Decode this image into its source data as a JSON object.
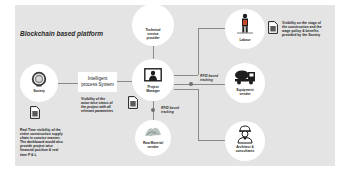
{
  "diagram": {
    "title": "Blockchain based platform",
    "colors": {
      "panel_bg": "#e4e4e4",
      "node_bg": "#ffffff",
      "line": "#8a8a8a",
      "text": "#222222"
    },
    "nodes": {
      "society": {
        "label": "Society",
        "icon": "society-seal-icon"
      },
      "intelligent_process": {
        "label_line1": "Intelligent",
        "label_line2": "process System"
      },
      "technical_service": {
        "label_line1": "Technical",
        "label_line2": "service",
        "label_line3": "provider"
      },
      "project_manager": {
        "label_line1": "Project",
        "label_line2": "Manager",
        "icon": "monitor-person-icon"
      },
      "raw_material": {
        "label_line1": "Raw Material",
        "label_line2": "vendor",
        "icon": "raw-material-icon"
      },
      "labour": {
        "label": "Labour",
        "icon": "worker-icon"
      },
      "equipment": {
        "label_line1": "Equipment",
        "label_line2": "vendor",
        "icon": "concrete-mixer-truck-icon"
      },
      "architect": {
        "label_line1": "Architect &",
        "label_line2": "consultants",
        "icon": "engineer-helmet-icon"
      }
    },
    "tags": {
      "rfid_right": {
        "line1": "RFID based",
        "line2": "tracking"
      },
      "rfid_bottom": {
        "line1": "RFID based",
        "line2": "tracking"
      }
    },
    "notes": {
      "society_note": {
        "lines": [
          "Real Time visibility of the",
          "entire construction supply",
          "chain in concise manner.",
          "The dashboard would also",
          "provide project wise",
          "financial position & real",
          "time P & L"
        ]
      },
      "pm_note": {
        "lines": [
          "Visibility of the",
          "actor wise status of",
          "the project with all",
          "relevant parameters"
        ]
      },
      "labour_note": {
        "lines": [
          "Visibility on the stage of",
          "the construction and the",
          "wage policy & benefits",
          "provided by the Society"
        ]
      }
    }
  }
}
